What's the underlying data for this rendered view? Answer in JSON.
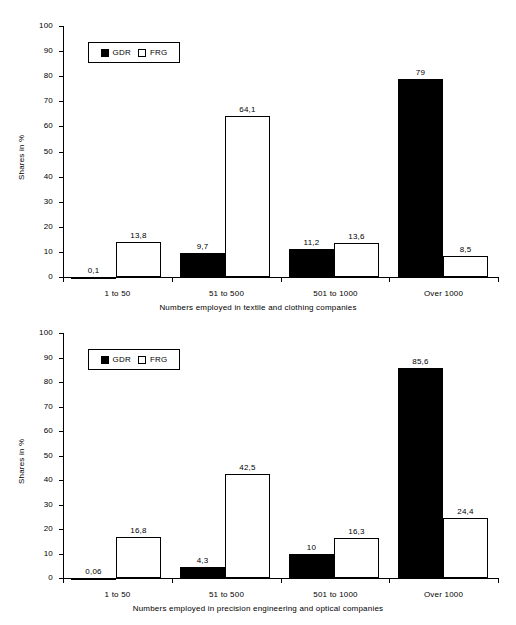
{
  "chart_data": [
    {
      "type": "bar",
      "title": "",
      "xlabel": "Numbers employed in textile and clothing companies",
      "ylabel": "Shares in %",
      "ylim": [
        0,
        100
      ],
      "ytick_step": 10,
      "yticks": [
        "0",
        "10",
        "20",
        "30",
        "40",
        "50",
        "60",
        "70",
        "80",
        "90",
        "100"
      ],
      "grid": false,
      "legend_position": "top-left-inside",
      "categories": [
        "1 to 50",
        "51 to 500",
        "501 to 1000",
        "Over 1000"
      ],
      "series": [
        {
          "name": "GDR",
          "color": "#000000",
          "values": [
            0.1,
            9.7,
            11.2,
            79
          ],
          "labels": [
            "0,1",
            "9,7",
            "11,2",
            "79"
          ]
        },
        {
          "name": "FRG",
          "color": "#ffffff",
          "values": [
            13.8,
            64.1,
            13.6,
            8.5
          ],
          "labels": [
            "13,8",
            "64,1",
            "13,6",
            "8,5"
          ]
        }
      ]
    },
    {
      "type": "bar",
      "title": "",
      "xlabel": "Numbers employed in precision engineering and optical companies",
      "ylabel": "Shares in %",
      "ylim": [
        0,
        100
      ],
      "ytick_step": 10,
      "yticks": [
        "0",
        "10",
        "20",
        "30",
        "40",
        "50",
        "60",
        "70",
        "80",
        "90",
        "100"
      ],
      "grid": false,
      "legend_position": "top-left-inside",
      "categories": [
        "1 to 50",
        "51 to 500",
        "501 to 1000",
        "Over 1000"
      ],
      "series": [
        {
          "name": "GDR",
          "color": "#000000",
          "values": [
            0.06,
            4.3,
            10,
            85.6
          ],
          "labels": [
            "0,06",
            "4,3",
            "10",
            "85,6"
          ]
        },
        {
          "name": "FRG",
          "color": "#ffffff",
          "values": [
            16.8,
            42.5,
            16.3,
            24.4
          ],
          "labels": [
            "16,8",
            "42,5",
            "16,3",
            "24,4"
          ]
        }
      ]
    }
  ],
  "colors": {
    "gdr": "#000000",
    "frg": "#ffffff",
    "axis": "#000000",
    "background": "#ffffff"
  }
}
